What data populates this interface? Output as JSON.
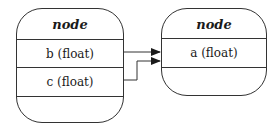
{
  "diagram": {
    "type": "record-graph",
    "nodes": [
      {
        "id": "left",
        "title": "node",
        "fields": [
          "b (float)",
          "c (float)"
        ]
      },
      {
        "id": "right",
        "title": "node",
        "fields": [
          "a (float)"
        ]
      }
    ],
    "edges": [
      {
        "from": "left.b (float)",
        "to": "right.a (float)"
      },
      {
        "from": "left.c (float)",
        "to": "right.a (float)"
      }
    ],
    "colors": {
      "stroke": "#333333",
      "background": "#ffffff",
      "text": "#1a1a1a"
    }
  }
}
